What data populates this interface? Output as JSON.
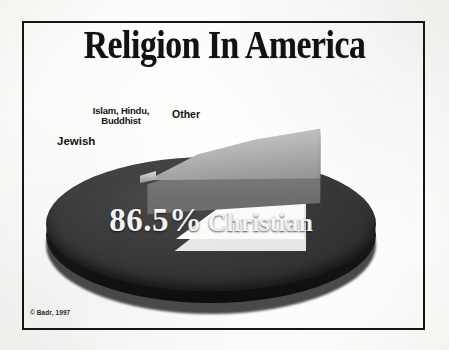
{
  "title": "Religion In America",
  "credit": "© Badr, 1997",
  "labels": {
    "islam_hindu_buddhist": "Islam, Hindu,\nBuddhist",
    "other": "Other",
    "jewish": "Jewish",
    "christian_pct": "86.5%",
    "christian_word": "Christian"
  },
  "colors": {
    "background": "#fdfdfc",
    "frame": "#151515",
    "main_slice": "#343434",
    "exploded_slice": "#a9a9a9",
    "title_text": "#121212",
    "slice_label_text": "#f2f2f2"
  },
  "chart_data": {
    "type": "pie",
    "title": "Religion In America",
    "categories": [
      "Christian",
      "Other",
      "Jewish",
      "Islam, Hindu, Buddhist"
    ],
    "values": [
      86.5,
      13.5,
      0,
      0
    ],
    "data_labels": [
      "86.5% Christian",
      "Other",
      "Jewish",
      "Islam, Hindu, Buddhist"
    ],
    "exploded": [
      "Other",
      "Jewish",
      "Islam, Hindu, Buddhist"
    ],
    "legend": "none",
    "three_d": true,
    "annotations": [
      "© Badr, 1997"
    ]
  }
}
